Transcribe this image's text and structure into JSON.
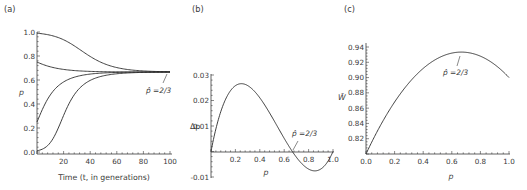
{
  "chart_data": [
    {
      "panel": "(a)",
      "type": "line",
      "title": "",
      "xlabel": "Time (t, in generations)",
      "ylabel": "p",
      "xlim": [
        0,
        100
      ],
      "ylim": [
        0,
        1.0
      ],
      "xticks": [
        "20",
        "40",
        "60",
        "80",
        "100"
      ],
      "xtick_values": [
        20,
        40,
        60,
        80,
        100
      ],
      "yticks": [
        "0.0",
        "0.2",
        "0.4",
        "0.6",
        "0.8",
        "1.0"
      ],
      "ytick_values": [
        0,
        0.2,
        0.4,
        0.6,
        0.8,
        1.0
      ],
      "fitness": {
        "w11": 0.9,
        "w12": 1.0,
        "w22": 0.8
      },
      "series": [
        {
          "name": "p0=0.99",
          "p0": 0.99
        },
        {
          "name": "p0=0.75",
          "p0": 0.75
        },
        {
          "name": "p0=0.25",
          "p0": 0.25
        },
        {
          "name": "p0=0.01",
          "p0": 0.01
        }
      ],
      "annotation": {
        "text": "p̂ =2/3",
        "x": 100,
        "y": 0.6667
      },
      "grid": false
    },
    {
      "panel": "(b)",
      "type": "line",
      "title": "",
      "xlabel": "p",
      "ylabel": "Δp",
      "xlim": [
        0,
        1.0
      ],
      "ylim": [
        -0.01,
        0.03
      ],
      "xticks": [
        "0.2",
        "0.4",
        "0.6",
        "0.8",
        "1.0"
      ],
      "xtick_values": [
        0.2,
        0.4,
        0.6,
        0.8,
        1.0
      ],
      "yticks": [
        "-0.01",
        "0.01",
        "0.02",
        "0.03"
      ],
      "ytick_values": [
        -0.01,
        0.01,
        0.02,
        0.03
      ],
      "fitness": {
        "w11": 0.9,
        "w12": 1.0,
        "w22": 0.8
      },
      "key_points": {
        "peak": [
          0.25,
          0.0264
        ],
        "equilibrium": [
          0.6667,
          0
        ],
        "trough": [
          0.86,
          -0.0075
        ]
      },
      "annotation": {
        "text": "p̂ =2/3",
        "x": 0.6667,
        "y": 0
      },
      "grid": false
    },
    {
      "panel": "(c)",
      "type": "line",
      "title": "",
      "xlabel": "p",
      "ylabel": "W̄",
      "xlim": [
        0,
        1.0
      ],
      "ylim": [
        0.8,
        0.945
      ],
      "xticks": [
        "0.0",
        "0.2",
        "0.4",
        "0.6",
        "0.8",
        "1.0"
      ],
      "xtick_values": [
        0,
        0.2,
        0.4,
        0.6,
        0.8,
        1.0
      ],
      "yticks": [
        "0.82",
        "0.84",
        "0.86",
        "0.88",
        "0.90",
        "0.92",
        "0.94"
      ],
      "ytick_values": [
        0.82,
        0.84,
        0.86,
        0.88,
        0.9,
        0.92,
        0.94
      ],
      "fitness": {
        "w11": 0.9,
        "w12": 1.0,
        "w22": 0.8
      },
      "key_points": {
        "start": [
          0,
          0.8
        ],
        "max": [
          0.6667,
          0.9333
        ],
        "end": [
          1.0,
          0.9
        ]
      },
      "annotation": {
        "text": "p̂ =2/3",
        "x": 0.6667,
        "y": 0.9333
      },
      "grid": false
    }
  ]
}
